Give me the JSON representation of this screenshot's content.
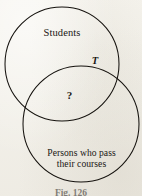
{
  "figure": {
    "type": "venn-diagram",
    "caption": "Fig. 126",
    "background_color": "#f2f0e9",
    "stroke_color": "#15120e",
    "sets": [
      {
        "id": "students",
        "label": "Students",
        "cx": 62,
        "cy": 64,
        "r": 57
      },
      {
        "id": "passers",
        "label_line_1": "Persons who pass",
        "label_line_2": "their courses",
        "cx": 81,
        "cy": 124,
        "r": 58
      }
    ],
    "annotations": {
      "boundary_label": "T",
      "intersection_label": "?"
    }
  }
}
